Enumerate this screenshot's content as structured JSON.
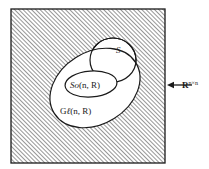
{
  "figure": {
    "kind": "set-inclusion-venn-diagram",
    "background_color": "#ffffff",
    "ink_color": "#1a1a1a",
    "hatch_color": "#4a4a4a",
    "fill_color": "#ffffff"
  },
  "ambient_space": {
    "name": "ambient-space-square",
    "label_base": "R",
    "label_superscript": "n×n",
    "label_full": "R^{n×n}",
    "shape": "square",
    "fill": "diagonal-hatching",
    "hatch_angle_degrees": 45,
    "hatch_spacing_px": 3,
    "x": 11,
    "y": 9,
    "width": 154,
    "height": 154
  },
  "pointer": {
    "name": "ambient-space-pointer",
    "type": "arrow",
    "direction": "left",
    "from_x": 192,
    "to_x": 167,
    "y": 85
  },
  "sets": [
    {
      "id": "gl",
      "name": "general-linear-group",
      "label": "Gℓ(n, R)",
      "label_parts": {
        "head": "G",
        "script": "ℓ",
        "tail": "(n, R)"
      },
      "shape": "ellipse",
      "cx": 95,
      "cy": 88,
      "rx": 48,
      "ry": 36,
      "rotation_degrees": -32,
      "label_x": 60,
      "label_y": 114
    },
    {
      "id": "so",
      "name": "special-orthogonal-group",
      "label": "So(n, R)",
      "label_parts": {
        "head": "So",
        "script": "",
        "tail": "(n, R)"
      },
      "shape": "ellipse",
      "cx": 91,
      "cy": 84,
      "rx": 26,
      "ry": 13,
      "rotation_degrees": -4,
      "label_x": 70,
      "label_y": 88
    },
    {
      "id": "s",
      "name": "set-s",
      "label": "S",
      "label_parts": {
        "head": "S",
        "script": "",
        "tail": ""
      },
      "shape": "circle",
      "cx": 113,
      "cy": 60,
      "rx": 23,
      "ry": 22,
      "rotation_degrees": 0,
      "label_x": 116,
      "label_y": 53
    }
  ],
  "text_sizes": {
    "set_label_px": 9,
    "ambient_label_px": 9,
    "ambient_superscript_px": 6,
    "s_label_px": 9
  }
}
